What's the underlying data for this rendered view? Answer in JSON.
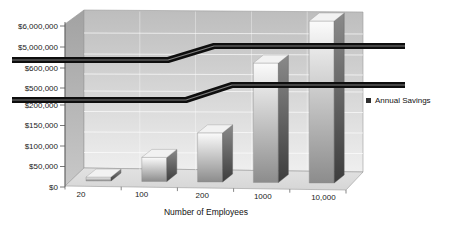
{
  "chart_data": {
    "type": "bar",
    "style": "3d-column-broken-axis",
    "title": "",
    "xlabel": "Number of Employees",
    "ylabel": "",
    "categories": [
      "20",
      "100",
      "200",
      "1000",
      "10,000"
    ],
    "series": [
      {
        "name": "Annual Savings",
        "values": [
          12000,
          60000,
          120000,
          600000,
          6000000
        ]
      }
    ],
    "y_axis": {
      "tick_labels": [
        "$0",
        "$50,000",
        "$100,000",
        "$150,000",
        "$200,000",
        "$500,000",
        "$600,000",
        "$5,000,000",
        "$6,000,000"
      ],
      "tick_values": [
        0,
        50000,
        100000,
        150000,
        200000,
        500000,
        600000,
        5000000,
        6000000
      ],
      "breaks": [
        {
          "after_value": 200000,
          "before_value": 500000
        },
        {
          "after_value": 600000,
          "before_value": 5000000
        }
      ]
    },
    "legend": {
      "label": "Annual Savings",
      "position": "right"
    },
    "grid": true
  },
  "colors": {
    "background": "#ffffff",
    "back_wall_top": "#bdbdbd",
    "back_wall_bottom": "#efefef",
    "side_wall_top": "#a2a2a2",
    "side_wall_bottom": "#c8c8c8",
    "floor_near": "#d6d6d6",
    "floor_far": "#e2e2e2",
    "gridline": "#ffffff",
    "edge": "#9a9a9a",
    "bar_front_top": "#fbfbfb",
    "bar_front_bottom": "#8c8c8c",
    "bar_side_top": "#8a8a8a",
    "bar_side_bottom": "#3d3d3d",
    "bar_top_face": "#f2f2f2",
    "break_band": "#0e0e0e",
    "break_band_highlight": "#8d8d8d",
    "axis_line": "#555555",
    "axis_text": "#1a1a1a",
    "legend_marker": "#2e2e2e"
  }
}
